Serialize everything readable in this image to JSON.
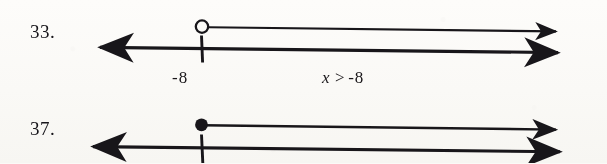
{
  "page": {
    "background_color": "#fbfaf7",
    "ink_color": "#18161a",
    "kind": "math-worksheet-number-lines"
  },
  "problems": [
    {
      "number_label": "33.",
      "point_value_label": "-8",
      "inequality": {
        "variable": "x",
        "relation": ">",
        "value": "-8",
        "full_text": "x > -8"
      },
      "endpoint_style": "open-circle",
      "ray_direction": "right",
      "number_line": {
        "left_arrow": true,
        "right_arrow": true,
        "tick_label": "-8"
      }
    },
    {
      "number_label": "37.",
      "point_value_label": "",
      "inequality": {
        "variable": "",
        "relation": "",
        "value": "",
        "full_text": ""
      },
      "endpoint_style": "filled-circle",
      "ray_direction": "right",
      "number_line": {
        "left_arrow": true,
        "right_arrow": true,
        "tick_label": ""
      }
    }
  ]
}
